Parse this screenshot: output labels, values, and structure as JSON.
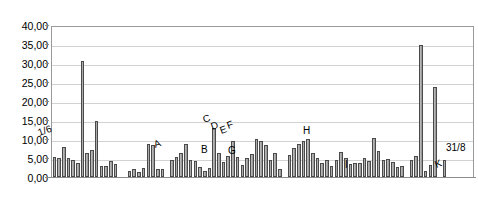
{
  "chart_data": {
    "type": "bar",
    "title": "",
    "subtitle": "",
    "xlabel": "",
    "ylabel": "",
    "ylim": [
      0,
      40
    ],
    "grid": true,
    "legend": "none",
    "decimal_separator": "comma",
    "bar_color": "#ababab",
    "bar_edge_color": "#4a4a4a",
    "gridline_color": "#d2d2d2",
    "axis_color": "#8c8c8c",
    "y_ticks": [
      "0,00",
      "5,00",
      "10,00",
      "15,00",
      "20,00",
      "25,00",
      "30,00",
      "35,00",
      "40,00"
    ],
    "y_tick_values": [
      0,
      5,
      10,
      15,
      20,
      25,
      30,
      35,
      40
    ],
    "x_tick_labels": [],
    "categories": [
      "1",
      "2",
      "3",
      "4",
      "5",
      "6",
      "7",
      "8",
      "9",
      "10",
      "11",
      "12",
      "13",
      "14",
      "15",
      "16",
      "17",
      "18",
      "19",
      "20",
      "21",
      "22",
      "23",
      "24",
      "25",
      "26",
      "27",
      "28",
      "29",
      "30",
      "31",
      "32",
      "33",
      "34",
      "35",
      "36",
      "37",
      "38",
      "39",
      "40",
      "41",
      "42",
      "43",
      "44",
      "45",
      "46",
      "47",
      "48",
      "49",
      "50",
      "51",
      "52",
      "53",
      "54",
      "55",
      "56",
      "57",
      "58",
      "59",
      "60",
      "61",
      "62",
      "63",
      "64",
      "65",
      "66",
      "67",
      "68",
      "69",
      "70",
      "71",
      "72",
      "73",
      "74",
      "75",
      "76",
      "77",
      "78",
      "79",
      "80",
      "81",
      "82",
      "83",
      "84",
      "85",
      "86",
      "87",
      "88",
      "89",
      "90"
    ],
    "values": [
      5.2,
      4.9,
      7.8,
      5.0,
      4.6,
      3.6,
      30.5,
      6.2,
      7.2,
      14.7,
      3.0,
      2.8,
      4.3,
      3.3,
      0.0,
      0.0,
      1.7,
      2.1,
      1.3,
      2.5,
      8.8,
      8.4,
      2.2,
      2.0,
      0.0,
      4.5,
      5.2,
      6.2,
      8.6,
      4.4,
      4.3,
      2.6,
      1.7,
      2.3,
      12.9,
      6.4,
      4.0,
      5.4,
      9.4,
      5.3,
      3.1,
      5.1,
      6.0,
      10.0,
      9.4,
      8.5,
      4.4,
      6.2,
      2.0,
      0.0,
      5.8,
      7.6,
      8.8,
      9.5,
      10.0,
      6.2,
      5.1,
      3.6,
      4.4,
      3.0,
      4.5,
      6.6,
      5.0,
      3.5,
      3.6,
      3.8,
      5.0,
      4.2,
      10.2,
      6.8,
      4.6,
      4.8,
      3.9,
      2.6,
      3.0,
      0.0,
      4.5,
      5.6,
      34.8,
      1.7,
      3.2,
      23.6,
      0.0,
      4.4,
      0.0,
      0.0,
      0.0,
      0.0,
      0.0,
      0.0
    ],
    "annotations": [
      {
        "label": "1/6",
        "x_index": 1,
        "value": 8.5
      },
      {
        "label": "A",
        "x_index": 25,
        "value": 6.8
      },
      {
        "label": "B",
        "x_index": 45,
        "value": 5.6
      },
      {
        "label": "C",
        "x_index": 44,
        "value": 11.2
      },
      {
        "label": "D",
        "x_index": 46,
        "value": 10.3
      },
      {
        "label": "E",
        "x_index": 48,
        "value": 9.8
      },
      {
        "label": "F",
        "x_index": 50,
        "value": 9.9
      },
      {
        "label": "G",
        "x_index": 53,
        "value": 5.5
      },
      {
        "label": "H",
        "x_index": 64,
        "value": 13.6
      },
      {
        "label": "I",
        "x_index": 73,
        "value": 3.3
      },
      {
        "label": "K",
        "x_index": 80,
        "value": 4.6
      },
      {
        "label": "31/8",
        "x_index": 84,
        "value": 7.8
      }
    ]
  },
  "annotation_positions": [
    {
      "name": "annotation-1-6",
      "label": "1/6",
      "left": 40,
      "top": 128,
      "rotated": true
    },
    {
      "name": "annotation-a",
      "label": "A",
      "left": 156,
      "top": 140,
      "rotated": true
    },
    {
      "name": "annotation-c",
      "label": "C",
      "left": 205,
      "top": 115,
      "rotated": true
    },
    {
      "name": "annotation-d",
      "label": "D",
      "left": 213,
      "top": 122,
      "rotated": true
    },
    {
      "name": "annotation-e",
      "label": "E",
      "left": 222,
      "top": 126,
      "rotated": true
    },
    {
      "name": "annotation-f",
      "label": "F",
      "left": 229,
      "top": 121,
      "rotated": true
    },
    {
      "name": "annotation-b",
      "label": "B",
      "left": 201,
      "top": 145,
      "rotated": false
    },
    {
      "name": "annotation-g",
      "label": "G",
      "left": 228,
      "top": 146,
      "rotated": false
    },
    {
      "name": "annotation-h",
      "label": "H",
      "left": 303,
      "top": 126,
      "rotated": false
    },
    {
      "name": "annotation-i",
      "label": "I",
      "left": 345,
      "top": 160,
      "rotated": false
    },
    {
      "name": "annotation-k",
      "label": "K",
      "left": 437,
      "top": 160,
      "rotated": true
    },
    {
      "name": "annotation-31-8",
      "label": "31/8",
      "left": 446,
      "top": 143,
      "rotated": false
    }
  ]
}
